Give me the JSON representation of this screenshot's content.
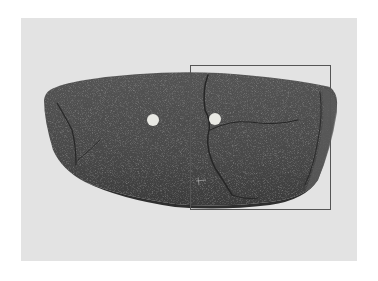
{
  "image": {
    "subject": "perforated stone knife fragment",
    "background_color": "#e3e3e3",
    "stone_color": "#4a4a4a",
    "holes": [
      {
        "cx": 153,
        "cy": 120,
        "r": 6
      },
      {
        "cx": 215,
        "cy": 119,
        "r": 6
      }
    ],
    "highlight_box": {
      "x": 190,
      "y": 65,
      "width": 141,
      "height": 145,
      "color": "#555555"
    }
  }
}
